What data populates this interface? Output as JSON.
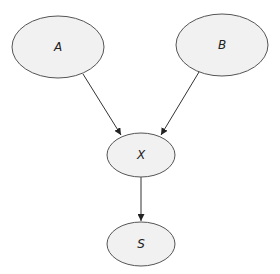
{
  "diagram": {
    "type": "directed-graph",
    "nodes": [
      {
        "id": "A",
        "label": "A",
        "cx": 58,
        "cy": 47,
        "rx": 46,
        "ry": 31
      },
      {
        "id": "B",
        "label": "B",
        "cx": 222,
        "cy": 45,
        "rx": 46,
        "ry": 31
      },
      {
        "id": "X",
        "label": "X",
        "cx": 141,
        "cy": 155,
        "rx": 34,
        "ry": 22
      },
      {
        "id": "S",
        "label": "S",
        "cx": 141,
        "cy": 244,
        "rx": 34,
        "ry": 22
      }
    ],
    "edges": [
      {
        "from": "A",
        "to": "X"
      },
      {
        "from": "B",
        "to": "X"
      },
      {
        "from": "X",
        "to": "S"
      }
    ],
    "colors": {
      "node_fill": "#f1f1f1",
      "node_stroke": "#555555",
      "edge": "#333333"
    }
  }
}
